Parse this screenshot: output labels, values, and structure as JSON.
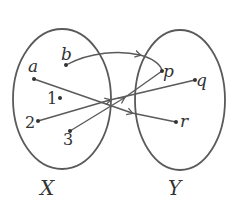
{
  "diagram": {
    "type": "function-mapping",
    "colors": {
      "stroke": "#5a5a5a",
      "text": "#333333",
      "background": "#ffffff"
    },
    "sets": [
      {
        "id": "X",
        "label": "X",
        "elements": [
          "a",
          "b",
          "1",
          "2",
          "3"
        ]
      },
      {
        "id": "Y",
        "label": "Y",
        "elements": [
          "p",
          "q",
          "r"
        ]
      }
    ],
    "mappings": [
      {
        "from": "b",
        "to": "p"
      },
      {
        "from": "a",
        "to": "r"
      },
      {
        "from": "2",
        "to": "q"
      },
      {
        "from": "3",
        "to": "p"
      }
    ],
    "labels": {
      "a": "a",
      "b": "b",
      "one": "1",
      "two": "2",
      "three": "3",
      "p": "p",
      "q": "q",
      "r": "r",
      "setX": "X",
      "setY": "Y"
    }
  }
}
